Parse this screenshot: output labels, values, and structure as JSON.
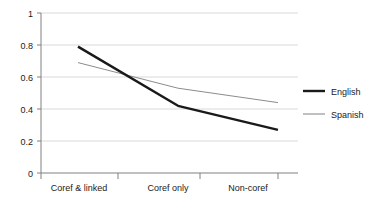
{
  "chart_data": {
    "type": "line",
    "title": "",
    "xlabel": "",
    "ylabel": "",
    "categories": [
      "Coref & linked",
      "Coref only",
      "Non-coref"
    ],
    "series": [
      {
        "name": "English",
        "values": [
          0.79,
          0.42,
          0.27
        ],
        "color": "#1a1a1a",
        "width": 2.4
      },
      {
        "name": "Spanish",
        "values": [
          0.69,
          0.53,
          0.44
        ],
        "color": "#8c8c8c",
        "width": 1.0
      }
    ],
    "ylim": [
      0,
      1
    ],
    "yticks": [
      "0",
      "0.2",
      "0.4",
      "0.6",
      "0.8",
      "1"
    ],
    "ytick_values": [
      0,
      0.2,
      0.4,
      0.6,
      0.8,
      1
    ],
    "grid": true,
    "grid_color": "#d9d9d9",
    "axis_color": "#808080",
    "legend_position": "right",
    "background": "#ffffff"
  },
  "legend": {
    "items": [
      {
        "label": "English"
      },
      {
        "label": "Spanish"
      }
    ]
  },
  "axes": {
    "y_tick_labels": [
      "1",
      "0.8",
      "0.6",
      "0.4",
      "0.2",
      "0"
    ],
    "x_tick_labels": [
      "Coref & linked",
      "Coref only",
      "Non-coref"
    ]
  }
}
